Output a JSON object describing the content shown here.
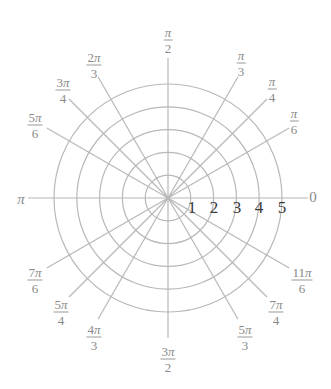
{
  "diagram": {
    "type": "polar-grid",
    "colors": {
      "grid": "#b8b8b8",
      "angle_label": "#8a8a8a",
      "radius_label": "#3a3a3a"
    },
    "center": [
      168,
      198
    ],
    "ring_spacing_px": 22.8,
    "ray_length_px": 140,
    "rings": [
      1,
      2,
      3,
      4,
      5
    ],
    "radius_labels": [
      {
        "text": "1",
        "x": 192,
        "y": 208
      },
      {
        "text": "2",
        "x": 214,
        "y": 208
      },
      {
        "text": "3",
        "x": 237,
        "y": 208
      },
      {
        "text": "4",
        "x": 259,
        "y": 208
      },
      {
        "text": "5",
        "x": 282,
        "y": 208
      }
    ],
    "angles_deg": [
      0,
      30,
      45,
      60,
      90,
      120,
      135,
      150,
      180,
      210,
      225,
      240,
      270,
      300,
      315,
      330
    ],
    "angle_labels": [
      {
        "id": "0",
        "num": "0",
        "den": "",
        "x": 313,
        "y": 197
      },
      {
        "id": "pi-6",
        "num": "π",
        "den": "6",
        "x": 294,
        "y": 121
      },
      {
        "id": "pi-4",
        "num": "π",
        "den": "4",
        "x": 272,
        "y": 89
      },
      {
        "id": "pi-3",
        "num": "π",
        "den": "3",
        "x": 241,
        "y": 63
      },
      {
        "id": "pi-2",
        "num": "π",
        "den": "2",
        "x": 168,
        "y": 40
      },
      {
        "id": "2pi-3",
        "num": "2π",
        "den": "3",
        "x": 94,
        "y": 65
      },
      {
        "id": "3pi-4",
        "num": "3π",
        "den": "4",
        "x": 63,
        "y": 90
      },
      {
        "id": "5pi-6",
        "num": "5π",
        "den": "6",
        "x": 35,
        "y": 125
      },
      {
        "id": "pi",
        "num": "π",
        "den": "",
        "x": 21,
        "y": 199
      },
      {
        "id": "7pi-6",
        "num": "7π",
        "den": "6",
        "x": 35,
        "y": 280
      },
      {
        "id": "5pi-4",
        "num": "5π",
        "den": "4",
        "x": 61,
        "y": 312
      },
      {
        "id": "4pi-3",
        "num": "4π",
        "den": "3",
        "x": 94,
        "y": 337
      },
      {
        "id": "3pi-2",
        "num": "3π",
        "den": "2",
        "x": 168,
        "y": 359
      },
      {
        "id": "5pi-3",
        "num": "5π",
        "den": "3",
        "x": 245,
        "y": 337
      },
      {
        "id": "7pi-4",
        "num": "7π",
        "den": "4",
        "x": 276,
        "y": 312
      },
      {
        "id": "11pi-6",
        "num": "11π",
        "den": "6",
        "x": 302,
        "y": 280
      }
    ]
  }
}
